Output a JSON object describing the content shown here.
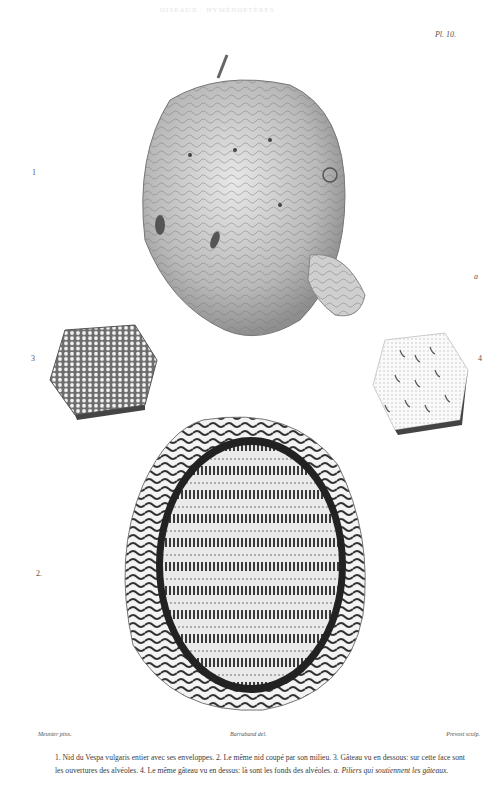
{
  "plate": {
    "header_faint": "OISEAUX · HYMÉNOPTÈRES",
    "plate_number": "Pl. 10."
  },
  "figure_labels": {
    "fig1": "1",
    "fig2": "2.",
    "fig3": "3",
    "fig4": "4",
    "fig_a": "a"
  },
  "credits": {
    "draughtsman": "Meunier pinx.",
    "lithographer": "Barraband del.",
    "engraver": "Prevost sculp."
  },
  "caption": {
    "line_parts": [
      "1. Nid du Vespa vulgaris entier avec ses enveloppes.",
      "2. Le même nid coupé par son milieu.",
      "3. Gâteau vu en dessous: sur cette face sont les ouvertures des alvéoles.",
      "4. Le même gâteau vu en dessus: là sont les fonds des alvéoles."
    ],
    "italic_note": "a. Piliers qui soutiennent les gâteaux."
  },
  "illustrations": [
    {
      "id": "fig1",
      "subject": "wasp-nest-exterior"
    },
    {
      "id": "fig2",
      "subject": "wasp-nest-cross-section"
    },
    {
      "id": "fig3",
      "subject": "comb-underside"
    },
    {
      "id": "fig4",
      "subject": "comb-topside"
    }
  ],
  "colors": {
    "ink": "#3a3a3a",
    "paper": "#ffffff",
    "shade": "#8a8a8a"
  }
}
